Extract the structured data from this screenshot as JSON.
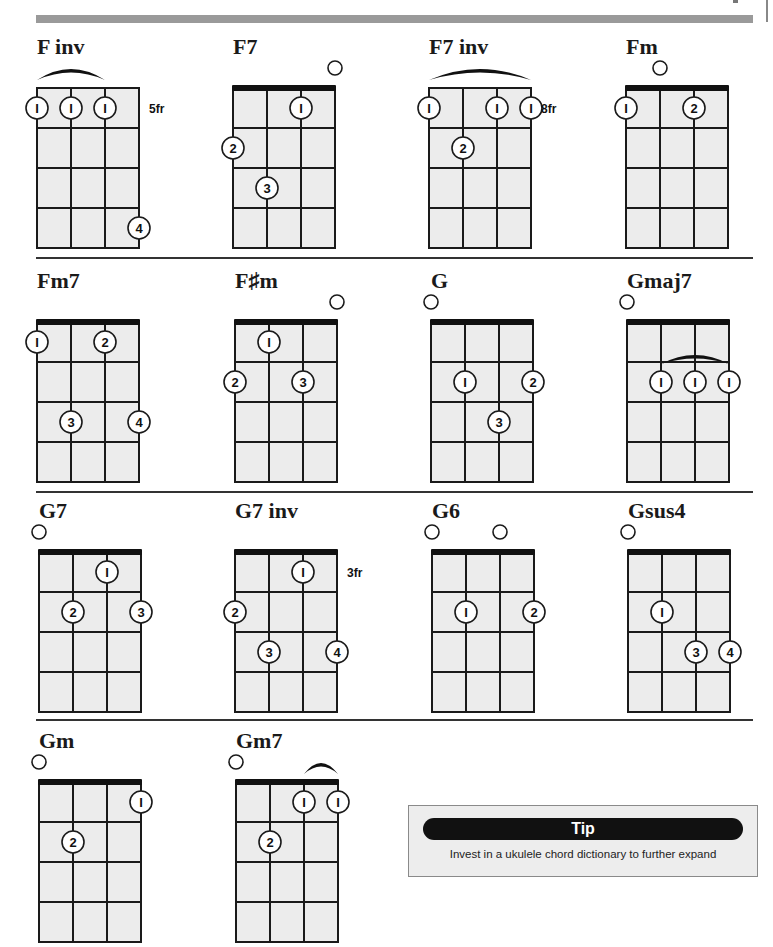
{
  "page": {
    "colors": {
      "grid_fill": "#ececec",
      "line": "#1a1a1a",
      "rule": "#9a9a9a"
    }
  },
  "chords": [
    {
      "name": "F inv",
      "x": 37,
      "y": 34,
      "nut": false,
      "fret_label": "5fr",
      "open": [],
      "barre": {
        "from": 0,
        "to": 2,
        "above": true
      },
      "fingers": [
        {
          "s": 0,
          "f": 1,
          "n": "1"
        },
        {
          "s": 1,
          "f": 1,
          "n": "1"
        },
        {
          "s": 2,
          "f": 1,
          "n": "1"
        },
        {
          "s": 3,
          "f": 4,
          "n": "4"
        }
      ]
    },
    {
      "name": "F7",
      "x": 233,
      "y": 34,
      "nut": true,
      "fret_label": "",
      "open": [
        3
      ],
      "barre": null,
      "fingers": [
        {
          "s": 2,
          "f": 1,
          "n": "1"
        },
        {
          "s": 0,
          "f": 2,
          "n": "2"
        },
        {
          "s": 1,
          "f": 3,
          "n": "3"
        }
      ]
    },
    {
      "name": "F7 inv",
      "x": 429,
      "y": 34,
      "nut": false,
      "fret_label": "8fr",
      "open": [],
      "barre": {
        "from": 0,
        "to": 3,
        "above": true
      },
      "fingers": [
        {
          "s": 0,
          "f": 1,
          "n": "1"
        },
        {
          "s": 2,
          "f": 1,
          "n": "1"
        },
        {
          "s": 3,
          "f": 1,
          "n": "1"
        },
        {
          "s": 1,
          "f": 2,
          "n": "2"
        }
      ]
    },
    {
      "name": "Fm",
      "x": 626,
      "y": 34,
      "nut": true,
      "fret_label": "",
      "open": [
        1
      ],
      "barre": null,
      "fingers": [
        {
          "s": 0,
          "f": 1,
          "n": "1"
        },
        {
          "s": 2,
          "f": 1,
          "n": "2"
        }
      ]
    },
    {
      "name": "Fm7",
      "x": 37,
      "y": 268,
      "nut": true,
      "fret_label": "",
      "open": [],
      "barre": null,
      "fingers": [
        {
          "s": 0,
          "f": 1,
          "n": "1"
        },
        {
          "s": 2,
          "f": 1,
          "n": "2"
        },
        {
          "s": 1,
          "f": 3,
          "n": "3"
        },
        {
          "s": 3,
          "f": 3,
          "n": "4"
        }
      ]
    },
    {
      "name": "F♯m",
      "x": 235,
      "y": 268,
      "nut": true,
      "fret_label": "",
      "open": [
        3
      ],
      "barre": null,
      "fingers": [
        {
          "s": 1,
          "f": 1,
          "n": "1"
        },
        {
          "s": 0,
          "f": 2,
          "n": "2"
        },
        {
          "s": 2,
          "f": 2,
          "n": "3"
        }
      ]
    },
    {
      "name": "G",
      "x": 431,
      "y": 268,
      "nut": true,
      "fret_label": "",
      "open": [
        0
      ],
      "barre": null,
      "fingers": [
        {
          "s": 1,
          "f": 2,
          "n": "1"
        },
        {
          "s": 3,
          "f": 2,
          "n": "2"
        },
        {
          "s": 2,
          "f": 3,
          "n": "3"
        }
      ]
    },
    {
      "name": "Gmaj7",
      "x": 627,
      "y": 268,
      "nut": true,
      "fret_label": "",
      "open": [
        0
      ],
      "barre": {
        "from": 1,
        "to": 3,
        "above": false
      },
      "fingers": [
        {
          "s": 1,
          "f": 2,
          "n": "1"
        },
        {
          "s": 2,
          "f": 2,
          "n": "1"
        },
        {
          "s": 3,
          "f": 2,
          "n": "1"
        }
      ]
    },
    {
      "name": "G7",
      "x": 39,
      "y": 498,
      "nut": true,
      "fret_label": "",
      "open": [
        0
      ],
      "barre": null,
      "fingers": [
        {
          "s": 2,
          "f": 1,
          "n": "1"
        },
        {
          "s": 1,
          "f": 2,
          "n": "2"
        },
        {
          "s": 3,
          "f": 2,
          "n": "3"
        }
      ]
    },
    {
      "name": "G7 inv",
      "x": 235,
      "y": 498,
      "nut": true,
      "fret_label": "3fr",
      "open": [],
      "barre": null,
      "fingers": [
        {
          "s": 2,
          "f": 1,
          "n": "1"
        },
        {
          "s": 0,
          "f": 2,
          "n": "2"
        },
        {
          "s": 1,
          "f": 3,
          "n": "3"
        },
        {
          "s": 3,
          "f": 3,
          "n": "4"
        }
      ]
    },
    {
      "name": "G6",
      "x": 432,
      "y": 498,
      "nut": true,
      "fret_label": "",
      "open": [
        0,
        2
      ],
      "barre": null,
      "fingers": [
        {
          "s": 1,
          "f": 2,
          "n": "1"
        },
        {
          "s": 3,
          "f": 2,
          "n": "2"
        }
      ]
    },
    {
      "name": "Gsus4",
      "x": 628,
      "y": 498,
      "nut": true,
      "fret_label": "",
      "open": [
        0
      ],
      "barre": null,
      "fingers": [
        {
          "s": 1,
          "f": 2,
          "n": "1"
        },
        {
          "s": 2,
          "f": 3,
          "n": "3"
        },
        {
          "s": 3,
          "f": 3,
          "n": "4"
        }
      ]
    },
    {
      "name": "Gm",
      "x": 39,
      "y": 728,
      "nut": true,
      "fret_label": "",
      "open": [
        0
      ],
      "barre": null,
      "fingers": [
        {
          "s": 3,
          "f": 1,
          "n": "1"
        },
        {
          "s": 1,
          "f": 2,
          "n": "2"
        }
      ]
    },
    {
      "name": "Gm7",
      "x": 236,
      "y": 728,
      "nut": true,
      "fret_label": "",
      "open": [
        0
      ],
      "barre": {
        "from": 2,
        "to": 3,
        "above": true
      },
      "fingers": [
        {
          "s": 2,
          "f": 1,
          "n": "1"
        },
        {
          "s": 3,
          "f": 1,
          "n": "1"
        },
        {
          "s": 1,
          "f": 2,
          "n": "2"
        }
      ]
    }
  ],
  "dividers_y": [
    257,
    491,
    719
  ],
  "tip": {
    "heading": "Tip",
    "text": "Invest in a ukulele chord dictionary to further expand"
  }
}
